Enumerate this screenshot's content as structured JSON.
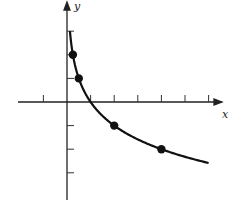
{
  "chart_data": {
    "type": "line",
    "title": "",
    "xlabel": "x",
    "ylabel": "y",
    "function": "y = -log2(x)",
    "xlim": [
      -2,
      6.3
    ],
    "ylim": [
      -4,
      4
    ],
    "x_ticks": [
      -1,
      1,
      2,
      3,
      4,
      5,
      6
    ],
    "y_ticks": [
      -3,
      -2,
      -1,
      1,
      2,
      3
    ],
    "tick_labels_shown": false,
    "grid": false,
    "legend": null,
    "series": [
      {
        "name": "curve",
        "x": [
          0.125,
          0.25,
          0.5,
          1,
          2,
          4,
          6
        ],
        "values": [
          3,
          2,
          1,
          0,
          -1,
          -2,
          -2.585
        ]
      }
    ],
    "marked_points": [
      {
        "x": 0.25,
        "y": 2
      },
      {
        "x": 0.5,
        "y": 1
      },
      {
        "x": 2,
        "y": -1
      },
      {
        "x": 4,
        "y": -2
      }
    ]
  },
  "labels": {
    "x_axis": "x",
    "y_axis": "y"
  }
}
